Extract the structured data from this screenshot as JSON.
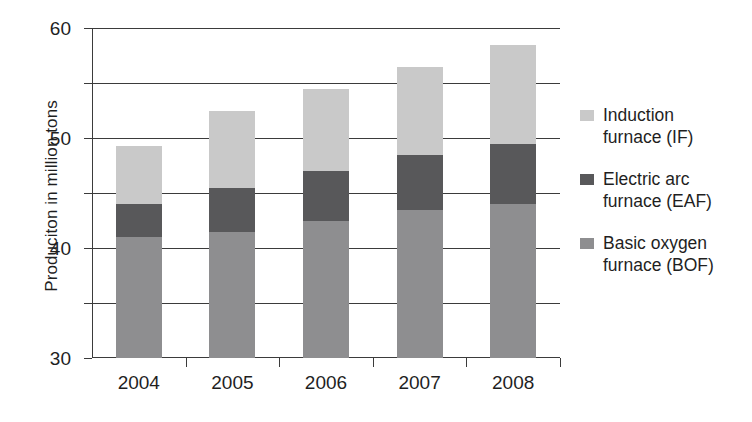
{
  "chart_data": {
    "type": "bar",
    "stacked": true,
    "title": "",
    "xlabel": "",
    "ylabel": "Produciton in million tons",
    "categories": [
      "2004",
      "2005",
      "2006",
      "2007",
      "2008"
    ],
    "series": [
      {
        "name": "Basic oxygen furnace (BOF)",
        "key": "bof",
        "color": "#8e8e90",
        "values": [
          22,
          23,
          25,
          27,
          28
        ]
      },
      {
        "name": "Electric arc furnace (EAF)",
        "key": "eaf",
        "color": "#58585a",
        "values": [
          6,
          8,
          9,
          10,
          11
        ]
      },
      {
        "name": "Induction furnace (IF)",
        "key": "if",
        "color": "#c9c9c9",
        "values": [
          10.5,
          14,
          15,
          16,
          18
        ]
      }
    ],
    "totals": [
      38.5,
      45,
      49,
      53,
      57
    ],
    "ylim": [
      0,
      60
    ],
    "yticks": [
      0,
      10,
      20,
      30,
      40,
      50,
      60
    ],
    "ytick_labels": [
      "0",
      "10",
      "20",
      "30",
      "40",
      "50",
      "60"
    ],
    "grid": true,
    "grid_axis": "y",
    "legend_position": "right"
  },
  "axis": {
    "y_label": "Produciton in million tons",
    "y_tick_labels": [
      "60",
      "50",
      "40",
      "30",
      "20",
      "10",
      "0"
    ],
    "x_tick_labels": [
      "2004",
      "2005",
      "2006",
      "2007",
      "2008"
    ]
  },
  "legend": {
    "items": [
      {
        "line1": "Induction",
        "line2": "furnace (IF)",
        "color": "#c9c9c9",
        "swatch_name": "legend-swatch-induction-furnace"
      },
      {
        "line1": "Electric arc",
        "line2": "furnace (EAF)",
        "color": "#58585a",
        "swatch_name": "legend-swatch-electric-arc-furnace"
      },
      {
        "line1": "Basic oxygen",
        "line2": "furnace (BOF)",
        "color": "#8e8e90",
        "swatch_name": "legend-swatch-basic-oxygen-furnace"
      }
    ]
  }
}
